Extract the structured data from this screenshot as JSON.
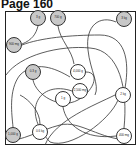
{
  "page": {
    "title": "Page 160"
  },
  "puzzle": {
    "type": "maze-path",
    "nodes": [
      {
        "label": "3 g",
        "x": 38,
        "y": 18,
        "shade": "gray"
      },
      {
        "label": "700 g",
        "x": 58,
        "y": 18,
        "shade": "gray"
      },
      {
        "label": "3 kg",
        "x": 124,
        "y": 19,
        "shade": "gray"
      },
      {
        "label": "900 mg",
        "x": 14,
        "y": 45,
        "shade": "gray"
      },
      {
        "label": "0.3 g",
        "x": 33,
        "y": 72,
        "shade": "gray"
      },
      {
        "label": "4,000 g",
        "x": 78,
        "y": 72,
        "shade": "white"
      },
      {
        "label": "2,500 mg",
        "x": 80,
        "y": 91,
        "shade": "white"
      },
      {
        "label": "1 g",
        "x": 63,
        "y": 99,
        "shade": "white"
      },
      {
        "label": "2 kg",
        "x": 123,
        "y": 95,
        "shade": "white"
      },
      {
        "label": "1,000 g",
        "x": 13,
        "y": 135,
        "shade": "gray"
      },
      {
        "label": "0.6 kg",
        "x": 40,
        "y": 132,
        "shade": "white"
      },
      {
        "label": "400 mg",
        "x": 124,
        "y": 136,
        "shade": "white"
      }
    ]
  },
  "colors": {
    "gray_fill": "#c8c8c8",
    "line": "#333333"
  }
}
